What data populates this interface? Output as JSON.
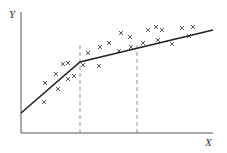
{
  "chart_data": {
    "type": "scatter",
    "title": "",
    "xlabel": "X",
    "ylabel": "Y",
    "grid": false,
    "markers": "x",
    "points_px": [
      [
        44,
        102
      ],
      [
        45,
        83
      ],
      [
        56,
        74
      ],
      [
        58,
        89
      ],
      [
        63,
        64
      ],
      [
        68,
        63
      ],
      [
        68,
        79
      ],
      [
        74,
        76
      ],
      [
        83,
        65
      ],
      [
        88,
        53
      ],
      [
        99,
        66
      ],
      [
        100,
        47
      ],
      [
        109,
        43
      ],
      [
        119,
        51
      ],
      [
        121,
        33
      ],
      [
        130,
        37
      ],
      [
        131,
        47
      ],
      [
        143,
        43
      ],
      [
        148,
        30
      ],
      [
        156,
        27
      ],
      [
        158,
        40
      ],
      [
        162,
        30
      ],
      [
        172,
        44
      ],
      [
        182,
        28
      ],
      [
        189,
        36
      ],
      [
        193,
        27
      ]
    ],
    "fit_line_px": [
      [
        21,
        113
      ],
      [
        80,
        62
      ],
      [
        213,
        30
      ]
    ],
    "dashed_verticals_px": [
      80,
      137
    ],
    "axes_px": {
      "origin": [
        21,
        133
      ],
      "x_end": 213,
      "y_top": 12
    }
  },
  "labels": {
    "x": "X",
    "y": "Y"
  }
}
